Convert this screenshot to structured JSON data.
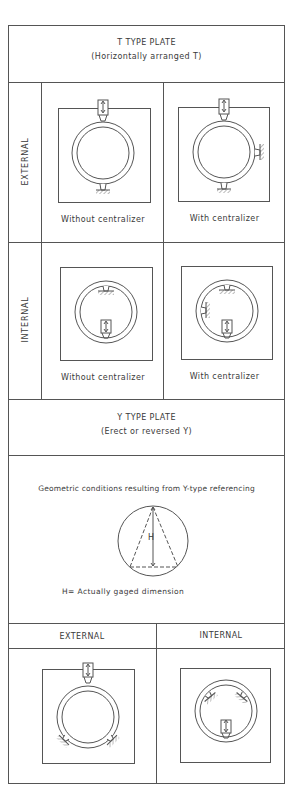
{
  "t_plate": {
    "title": "T TYPE PLATE",
    "subtitle": "(Horizontally arranged T)",
    "rows": [
      {
        "label": "EXTERNAL",
        "cells": [
          {
            "caption": "Without centralizer"
          },
          {
            "caption": "With centralizer"
          }
        ]
      },
      {
        "label": "INTERNAL",
        "cells": [
          {
            "caption": "Without centralizer"
          },
          {
            "caption": "With centralizer"
          }
        ]
      }
    ]
  },
  "y_plate": {
    "title": "Y TYPE PLATE",
    "subtitle": "(Erect or reversed Y)",
    "geometry_caption": "Geometric conditions resulting from Y-type referencing",
    "h_symbol": "H",
    "h_legend": "H= Actually gaged dimension",
    "columns": [
      {
        "label": "EXTERNAL"
      },
      {
        "label": "INTERNAL"
      }
    ]
  },
  "colors": {
    "line": "#555555",
    "background": "#ffffff",
    "text": "#3a3a3a"
  }
}
